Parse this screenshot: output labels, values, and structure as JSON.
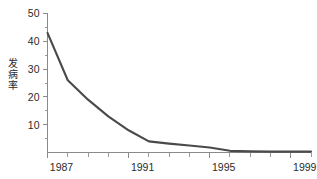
{
  "chart_data": {
    "type": "line",
    "title": "",
    "subtitle": "",
    "xlabel": "",
    "ylabel": "发病率",
    "xlim": [
      1987,
      2000
    ],
    "ylim": [
      0,
      50
    ],
    "grid": false,
    "legend": false,
    "legend_position": "none",
    "line_color": "#4a4a4a",
    "axis_color": "#8a8a8a",
    "background_color": "#ffffff",
    "x": [
      1987,
      1988,
      1989,
      1990,
      1991,
      1992,
      1993,
      1994,
      1995,
      1996,
      1997,
      1998,
      1999,
      2000
    ],
    "values": [
      43,
      26,
      19,
      13,
      8,
      4,
      3.2,
      2.5,
      1.8,
      0.6,
      0.4,
      0.3,
      0.3,
      0.3
    ],
    "series": [
      {
        "name": "发病率",
        "values": [
          43,
          26,
          19,
          13,
          8,
          4,
          3.2,
          2.5,
          1.8,
          0.6,
          0.4,
          0.3,
          0.3,
          0.3
        ]
      }
    ],
    "y_ticks_major": [
      10,
      20,
      30,
      40,
      50
    ],
    "y_ticks_major_labels": [
      "10",
      "20",
      "30",
      "40",
      "50"
    ],
    "y_ticks_minor": [
      5,
      15,
      25,
      35,
      45
    ],
    "x_ticks_major": [
      1987,
      1991,
      1995,
      1999
    ],
    "x_ticks_major_labels": [
      "1987",
      "1991",
      "1995",
      "1999"
    ],
    "x_ticks_minor": [
      1988,
      1989,
      1990,
      1992,
      1993,
      1994,
      1996,
      1997,
      1998,
      2000
    ],
    "annotations": []
  },
  "axis": {
    "y_label_chars": [
      "发",
      "病",
      "率"
    ],
    "y_label": "发病率"
  }
}
